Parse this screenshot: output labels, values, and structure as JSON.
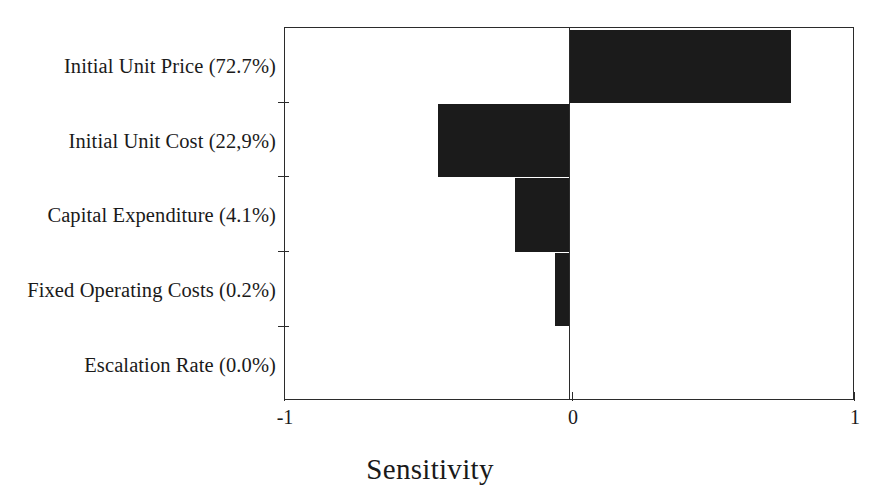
{
  "chart_data": {
    "type": "bar",
    "orientation": "horizontal",
    "title": "",
    "xlabel": "Sensitivity",
    "ylabel": "",
    "xlim": [
      -1,
      1
    ],
    "xticks": [
      -1,
      0,
      1
    ],
    "xticklabels": [
      "-1",
      "0",
      "1"
    ],
    "grid": false,
    "legend": false,
    "bar_color": "#1b1b1b",
    "axis_color": "#2b2b2b",
    "categories": [
      "Initial Unit Price (72.7%)",
      "Initial Unit Cost (22,9%)",
      "Capital Expenditure (4.1%)",
      "Fixed Operating Costs (0.2%)",
      "Escalation Rate (0.0%)"
    ],
    "values": [
      0.78,
      -0.46,
      -0.19,
      -0.05,
      0.0
    ],
    "contributions_percent": [
      72.7,
      22.9,
      4.1,
      0.2,
      0.0
    ]
  },
  "axis": {
    "x_title": "Sensitivity",
    "tick_labels": [
      "-1",
      "0",
      "1"
    ]
  },
  "labels": {
    "c0": "Initial Unit Price (72.7%)",
    "c1": "Initial Unit Cost (22,9%)",
    "c2": "Capital Expenditure (4.1%)",
    "c3": "Fixed Operating Costs (0.2%)",
    "c4": "Escalation Rate (0.0%)"
  }
}
